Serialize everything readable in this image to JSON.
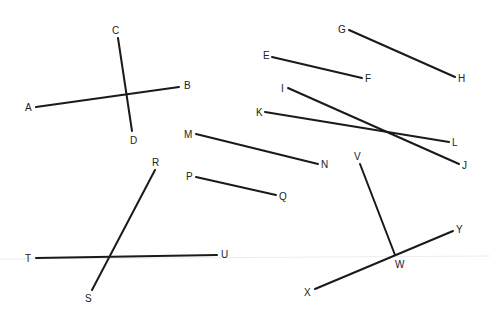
{
  "diagram": {
    "title": "",
    "background": "#ffffff",
    "line_color": "#1a1a1a",
    "segments": [
      {
        "name": "AB",
        "x1": 36,
        "y1": 107,
        "x2": 179,
        "y2": 87
      },
      {
        "name": "CD",
        "x1": 118,
        "y1": 38,
        "x2": 132,
        "y2": 131
      },
      {
        "name": "EF",
        "x1": 272,
        "y1": 57,
        "x2": 362,
        "y2": 78
      },
      {
        "name": "GH",
        "x1": 349,
        "y1": 30,
        "x2": 455,
        "y2": 77
      },
      {
        "name": "IJ",
        "x1": 288,
        "y1": 88,
        "x2": 459,
        "y2": 164
      },
      {
        "name": "KL",
        "x1": 265,
        "y1": 112,
        "x2": 449,
        "y2": 142
      },
      {
        "name": "MN",
        "x1": 196,
        "y1": 134,
        "x2": 318,
        "y2": 164
      },
      {
        "name": "PQ",
        "x1": 196,
        "y1": 177,
        "x2": 276,
        "y2": 195
      },
      {
        "name": "RS",
        "x1": 155,
        "y1": 170,
        "x2": 92,
        "y2": 290
      },
      {
        "name": "TU",
        "x1": 36,
        "y1": 258,
        "x2": 217,
        "y2": 255
      },
      {
        "name": "VW",
        "x1": 360,
        "y1": 164,
        "x2": 395,
        "y2": 255
      },
      {
        "name": "XY",
        "x1": 315,
        "y1": 289,
        "x2": 453,
        "y2": 231
      }
    ],
    "labels": [
      {
        "text": "A",
        "x": 25,
        "y": 111
      },
      {
        "text": "B",
        "x": 184,
        "y": 89
      },
      {
        "text": "C",
        "x": 112,
        "y": 34
      },
      {
        "text": "D",
        "x": 130,
        "y": 144
      },
      {
        "text": "E",
        "x": 263,
        "y": 59
      },
      {
        "text": "F",
        "x": 365,
        "y": 82
      },
      {
        "text": "G",
        "x": 338,
        "y": 33
      },
      {
        "text": "H",
        "x": 458,
        "y": 82
      },
      {
        "text": "I",
        "x": 281,
        "y": 92
      },
      {
        "text": "J",
        "x": 462,
        "y": 169
      },
      {
        "text": "K",
        "x": 256,
        "y": 116
      },
      {
        "text": "L",
        "x": 452,
        "y": 146
      },
      {
        "text": "M",
        "x": 184,
        "y": 138
      },
      {
        "text": "N",
        "x": 321,
        "y": 168
      },
      {
        "text": "P",
        "x": 186,
        "y": 180
      },
      {
        "text": "Q",
        "x": 279,
        "y": 200
      },
      {
        "text": "R",
        "x": 152,
        "y": 166
      },
      {
        "text": "S",
        "x": 85,
        "y": 302
      },
      {
        "text": "T",
        "x": 25,
        "y": 262
      },
      {
        "text": "U",
        "x": 221,
        "y": 258
      },
      {
        "text": "V",
        "x": 354,
        "y": 160
      },
      {
        "text": "W",
        "x": 395,
        "y": 268
      },
      {
        "text": "X",
        "x": 304,
        "y": 296
      },
      {
        "text": "Y",
        "x": 456,
        "y": 233
      }
    ]
  }
}
